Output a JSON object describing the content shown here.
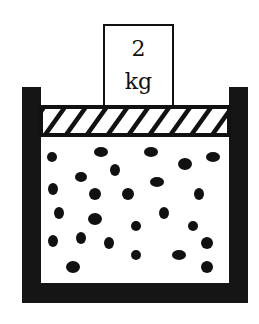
{
  "diagram": {
    "weight": {
      "value": "2",
      "unit": "kg",
      "box": {
        "x": 104,
        "y": 25,
        "w": 69,
        "h": 82
      }
    },
    "cylinder": {
      "left_wall": {
        "x": 22,
        "y": 87,
        "w": 19,
        "h": 216
      },
      "right_wall": {
        "x": 229,
        "y": 87,
        "w": 19,
        "h": 216
      },
      "bottom": {
        "x": 22,
        "y": 283,
        "w": 226,
        "h": 20
      },
      "color": "#151515"
    },
    "piston": {
      "x": 41,
      "y": 107,
      "w": 188,
      "h": 28,
      "hatch_count": 9,
      "style": "diagonal-hatch"
    },
    "molecules": [
      {
        "cx": 52,
        "cy": 157,
        "rx": 5,
        "ry": 5
      },
      {
        "cx": 101,
        "cy": 152,
        "rx": 7,
        "ry": 5
      },
      {
        "cx": 151,
        "cy": 152,
        "rx": 7,
        "ry": 5
      },
      {
        "cx": 185,
        "cy": 164,
        "rx": 7,
        "ry": 6
      },
      {
        "cx": 213,
        "cy": 157,
        "rx": 7,
        "ry": 5
      },
      {
        "cx": 115,
        "cy": 170,
        "rx": 5,
        "ry": 6
      },
      {
        "cx": 81,
        "cy": 177,
        "rx": 6,
        "ry": 5
      },
      {
        "cx": 157,
        "cy": 182,
        "rx": 7,
        "ry": 5
      },
      {
        "cx": 53,
        "cy": 189,
        "rx": 5,
        "ry": 6
      },
      {
        "cx": 95,
        "cy": 194,
        "rx": 6,
        "ry": 6
      },
      {
        "cx": 128,
        "cy": 194,
        "rx": 6,
        "ry": 6
      },
      {
        "cx": 199,
        "cy": 194,
        "rx": 5,
        "ry": 6
      },
      {
        "cx": 59,
        "cy": 213,
        "rx": 5,
        "ry": 6
      },
      {
        "cx": 95,
        "cy": 219,
        "rx": 7,
        "ry": 6
      },
      {
        "cx": 164,
        "cy": 213,
        "rx": 5,
        "ry": 6
      },
      {
        "cx": 136,
        "cy": 226,
        "rx": 5,
        "ry": 5
      },
      {
        "cx": 193,
        "cy": 226,
        "rx": 5,
        "ry": 5
      },
      {
        "cx": 53,
        "cy": 241,
        "rx": 5,
        "ry": 6
      },
      {
        "cx": 81,
        "cy": 238,
        "rx": 5,
        "ry": 6
      },
      {
        "cx": 109,
        "cy": 243,
        "rx": 5,
        "ry": 6
      },
      {
        "cx": 207,
        "cy": 243,
        "rx": 6,
        "ry": 6
      },
      {
        "cx": 136,
        "cy": 255,
        "rx": 5,
        "ry": 5
      },
      {
        "cx": 179,
        "cy": 255,
        "rx": 7,
        "ry": 5
      },
      {
        "cx": 73,
        "cy": 267,
        "rx": 7,
        "ry": 6
      },
      {
        "cx": 207,
        "cy": 267,
        "rx": 6,
        "ry": 6
      }
    ],
    "colors": {
      "ink": "#111111",
      "background": "#ffffff"
    }
  }
}
